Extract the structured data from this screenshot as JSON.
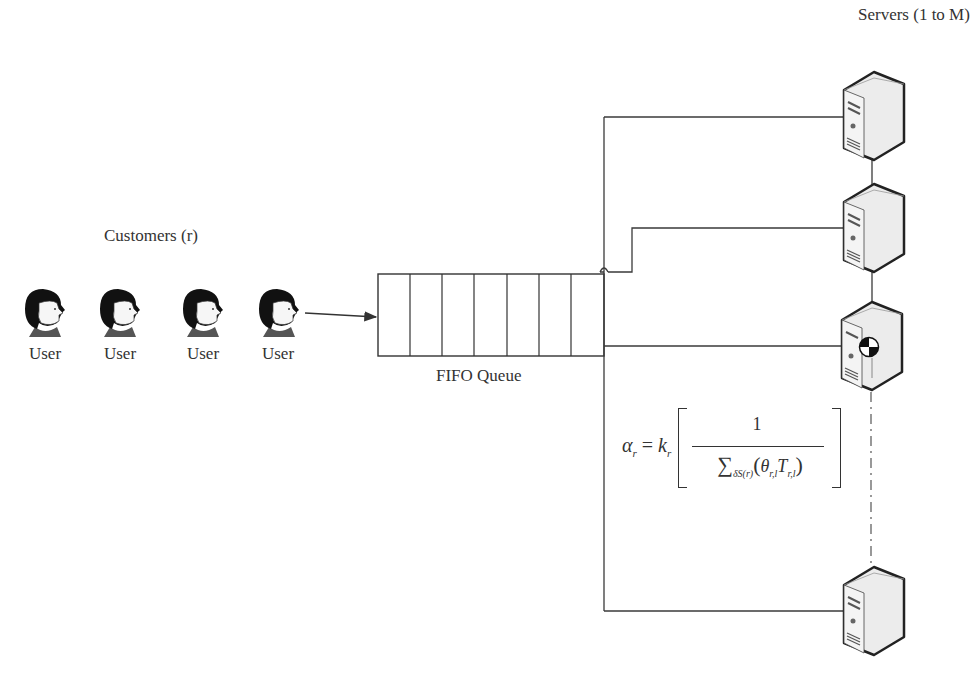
{
  "customers": {
    "group_label": "Customers (r)",
    "users": [
      {
        "label": "User",
        "icon": "user-avatar-icon"
      },
      {
        "label": "User",
        "icon": "user-avatar-icon"
      },
      {
        "label": "User",
        "icon": "user-avatar-icon"
      },
      {
        "label": "User",
        "icon": "user-avatar-icon"
      }
    ]
  },
  "queue": {
    "label": "FIFO Queue",
    "cell_count": 7
  },
  "servers": {
    "group_label": "Servers (1 to M)",
    "items": [
      {
        "icon": "server-tower-icon"
      },
      {
        "icon": "server-tower-icon"
      },
      {
        "icon": "server-tower-icon",
        "status_badge": "pie-indicator"
      },
      {
        "icon": "server-tower-icon"
      }
    ],
    "ellipsis": "dash-dot connector (more servers)"
  },
  "formula": {
    "lhs": "α",
    "lhs_sub": "r",
    "equals": " = ",
    "coef": "k",
    "coef_sub": "r",
    "numerator": "1",
    "sum_symbol": "∑",
    "sum_sub": "δS(r)",
    "den_open": "(",
    "theta": "θ",
    "theta_sub": "r,l",
    "t": "T",
    "t_sub": "r,l",
    "den_close": ")"
  },
  "colors": {
    "line": "#3a3a3a",
    "text": "#333333",
    "hair": "#111111",
    "face": "#f7f7f7",
    "server_body": "#e6e6e6"
  }
}
